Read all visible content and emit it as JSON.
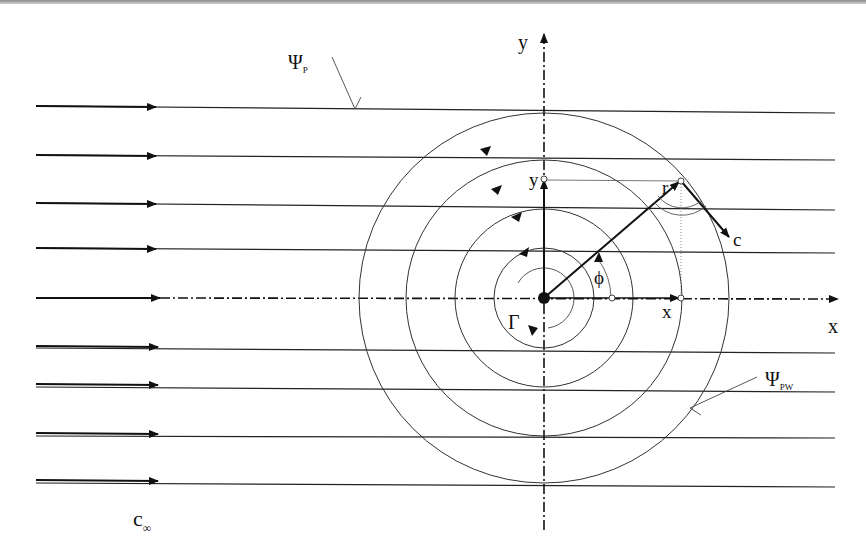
{
  "diagram": {
    "labels": {
      "y_axis": "y",
      "x_axis": "x",
      "point_y": "y",
      "point_x": "x",
      "radius": "r",
      "velocity": "c",
      "angle": "ϕ",
      "circulation": "Γ",
      "stream_parallel": "Ψ",
      "stream_parallel_sub": "P",
      "stream_combined": "Ψ",
      "stream_combined_sub": "PW",
      "freestream": "c",
      "freestream_sub": "∞"
    },
    "geometry": {
      "origin": [
        544,
        298
      ],
      "circle_radii": [
        50,
        89,
        138,
        185
      ],
      "inner_arc_radius": 30,
      "streamline_y": [
        106,
        155,
        203,
        248,
        298,
        348,
        387,
        436,
        483
      ],
      "point": [
        681,
        181
      ]
    },
    "colors": {
      "line": "#1a1a1a",
      "thin": "#444444",
      "background": "#ffffff"
    }
  }
}
